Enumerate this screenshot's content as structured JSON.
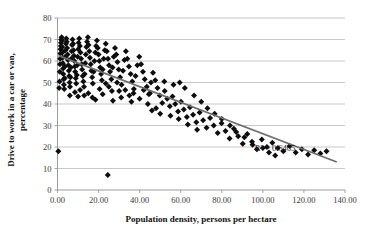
{
  "chart_data": {
    "type": "scatter",
    "title": "",
    "xlabel": "Population density, persons per hectare",
    "ylabel": "Drive to work in a car or van, percentage",
    "ylabel_line1": "Drive to work in a car or van,",
    "ylabel_line2": "percentage",
    "xlim": [
      0,
      140
    ],
    "ylim": [
      0,
      80
    ],
    "xticks": [
      0,
      20,
      40,
      60,
      80,
      100,
      120,
      140
    ],
    "xtick_labels": [
      "0.00",
      "20.00",
      "40.00",
      "60.00",
      "80.00",
      "100.00",
      "120.00",
      "140.00"
    ],
    "yticks": [
      0,
      10,
      20,
      30,
      40,
      50,
      60,
      70,
      80
    ],
    "ytick_labels": [
      "0",
      "10",
      "20",
      "30",
      "40",
      "50",
      "60",
      "70",
      "80"
    ],
    "grid": "horizontal",
    "legend": "none",
    "marker": "diamond",
    "marker_color": "#0d0d0d",
    "trendline": {
      "type": "linear",
      "color": "#6e6e6e",
      "x_start": 0.5,
      "y_start": 62.5,
      "x_end": 136.0,
      "y_end": 13.0,
      "slope": -0.3653,
      "intercept": 62.68
    },
    "annotations": [
      {
        "name": "r-squared",
        "text": "R² = 0.6465",
        "x": 96.0,
        "y": 18.0
      }
    ],
    "r_squared": 0.6465,
    "points": [
      [
        0.4,
        18.0
      ],
      [
        24.5,
        7.0
      ],
      [
        0.8,
        47.5
      ],
      [
        1.0,
        50.5
      ],
      [
        1.1,
        55.0
      ],
      [
        1.2,
        58.5
      ],
      [
        1.3,
        61.0
      ],
      [
        1.4,
        63.5
      ],
      [
        1.5,
        65.5
      ],
      [
        1.6,
        67.0
      ],
      [
        1.7,
        68.5
      ],
      [
        1.8,
        70.0
      ],
      [
        2.0,
        71.0
      ],
      [
        2.2,
        69.5
      ],
      [
        2.3,
        66.5
      ],
      [
        2.4,
        64.0
      ],
      [
        2.5,
        61.5
      ],
      [
        2.6,
        59.0
      ],
      [
        2.7,
        56.5
      ],
      [
        2.8,
        54.0
      ],
      [
        3.0,
        51.5
      ],
      [
        3.1,
        49.0
      ],
      [
        3.3,
        47.0
      ],
      [
        3.5,
        52.0
      ],
      [
        3.6,
        57.5
      ],
      [
        3.8,
        62.0
      ],
      [
        3.9,
        65.0
      ],
      [
        4.1,
        68.0
      ],
      [
        4.3,
        70.5
      ],
      [
        4.5,
        69.0
      ],
      [
        4.7,
        66.0
      ],
      [
        4.9,
        63.0
      ],
      [
        5.1,
        60.5
      ],
      [
        5.3,
        58.0
      ],
      [
        5.5,
        55.5
      ],
      [
        5.7,
        53.0
      ],
      [
        5.9,
        50.0
      ],
      [
        6.1,
        48.0
      ],
      [
        6.3,
        52.5
      ],
      [
        6.5,
        57.0
      ],
      [
        6.7,
        61.0
      ],
      [
        6.9,
        64.5
      ],
      [
        7.1,
        67.5
      ],
      [
        7.3,
        70.0
      ],
      [
        7.6,
        68.0
      ],
      [
        7.8,
        65.0
      ],
      [
        8.0,
        62.5
      ],
      [
        8.2,
        60.0
      ],
      [
        8.4,
        57.5
      ],
      [
        8.6,
        55.0
      ],
      [
        8.9,
        52.0
      ],
      [
        9.1,
        49.5
      ],
      [
        9.4,
        53.5
      ],
      [
        9.6,
        58.0
      ],
      [
        9.8,
        62.0
      ],
      [
        10.1,
        65.5
      ],
      [
        10.3,
        68.5
      ],
      [
        10.6,
        70.5
      ],
      [
        10.9,
        67.0
      ],
      [
        11.2,
        64.0
      ],
      [
        11.5,
        61.0
      ],
      [
        11.8,
        58.5
      ],
      [
        12.0,
        56.0
      ],
      [
        12.3,
        53.0
      ],
      [
        12.6,
        50.5
      ],
      [
        12.9,
        48.0
      ],
      [
        13.2,
        54.0
      ],
      [
        13.5,
        59.0
      ],
      [
        13.8,
        63.0
      ],
      [
        14.1,
        66.5
      ],
      [
        14.4,
        69.0
      ],
      [
        14.8,
        71.0
      ],
      [
        15.1,
        67.5
      ],
      [
        15.5,
        64.5
      ],
      [
        15.8,
        61.5
      ],
      [
        16.2,
        58.5
      ],
      [
        16.5,
        55.5
      ],
      [
        16.9,
        52.5
      ],
      [
        17.2,
        49.5
      ],
      [
        17.6,
        55.0
      ],
      [
        18.0,
        60.0
      ],
      [
        18.4,
        64.0
      ],
      [
        18.8,
        67.0
      ],
      [
        19.2,
        69.5
      ],
      [
        19.6,
        66.0
      ],
      [
        20.0,
        63.0
      ],
      [
        20.4,
        60.0
      ],
      [
        20.8,
        57.0
      ],
      [
        21.2,
        54.0
      ],
      [
        21.6,
        51.0
      ],
      [
        22.0,
        56.0
      ],
      [
        22.5,
        61.0
      ],
      [
        23.0,
        65.0
      ],
      [
        23.5,
        68.0
      ],
      [
        24.0,
        64.5
      ],
      [
        24.6,
        61.0
      ],
      [
        25.1,
        58.0
      ],
      [
        25.6,
        55.0
      ],
      [
        26.2,
        51.5
      ],
      [
        26.8,
        57.0
      ],
      [
        27.4,
        62.0
      ],
      [
        28.0,
        66.0
      ],
      [
        28.6,
        63.0
      ],
      [
        29.2,
        59.5
      ],
      [
        29.8,
        56.0
      ],
      [
        30.5,
        52.5
      ],
      [
        31.2,
        49.0
      ],
      [
        31.9,
        55.5
      ],
      [
        32.6,
        60.5
      ],
      [
        33.3,
        64.5
      ],
      [
        34.0,
        61.0
      ],
      [
        34.8,
        57.5
      ],
      [
        35.6,
        54.0
      ],
      [
        36.4,
        50.5
      ],
      [
        37.2,
        47.0
      ],
      [
        38.0,
        53.0
      ],
      [
        38.9,
        58.0
      ],
      [
        39.8,
        62.0
      ],
      [
        40.7,
        58.5
      ],
      [
        41.6,
        55.0
      ],
      [
        42.5,
        51.5
      ],
      [
        43.5,
        48.0
      ],
      [
        44.5,
        44.5
      ],
      [
        45.5,
        50.0
      ],
      [
        46.5,
        54.5
      ],
      [
        47.6,
        51.0
      ],
      [
        48.7,
        47.5
      ],
      [
        49.8,
        44.0
      ],
      [
        51.0,
        40.5
      ],
      [
        52.2,
        46.0
      ],
      [
        53.4,
        42.5
      ],
      [
        54.7,
        39.0
      ],
      [
        56.0,
        43.5
      ],
      [
        57.3,
        40.0
      ],
      [
        58.7,
        36.5
      ],
      [
        60.1,
        41.0
      ],
      [
        61.5,
        37.5
      ],
      [
        63.0,
        34.0
      ],
      [
        64.5,
        38.5
      ],
      [
        66.0,
        35.0
      ],
      [
        67.6,
        31.5
      ],
      [
        69.2,
        36.0
      ],
      [
        70.9,
        32.5
      ],
      [
        72.6,
        29.0
      ],
      [
        74.3,
        33.5
      ],
      [
        76.1,
        30.0
      ],
      [
        78.0,
        26.5
      ],
      [
        79.9,
        31.0
      ],
      [
        81.8,
        27.5
      ],
      [
        83.8,
        24.0
      ],
      [
        85.9,
        28.5
      ],
      [
        88.0,
        25.0
      ],
      [
        90.2,
        21.5
      ],
      [
        92.4,
        26.0
      ],
      [
        94.7,
        22.5
      ],
      [
        97.1,
        19.0
      ],
      [
        99.5,
        23.5
      ],
      [
        102.0,
        20.0
      ],
      [
        104.6,
        22.0
      ],
      [
        107.3,
        19.5
      ],
      [
        110.0,
        18.0
      ],
      [
        113.0,
        20.5
      ],
      [
        116.0,
        17.5
      ],
      [
        119.0,
        19.0
      ],
      [
        122.0,
        16.5
      ],
      [
        125.0,
        18.5
      ],
      [
        128.0,
        17.0
      ],
      [
        131.0,
        18.0
      ],
      [
        10.0,
        43.5
      ],
      [
        13.0,
        44.0
      ],
      [
        18.5,
        42.0
      ],
      [
        22.0,
        44.5
      ],
      [
        27.0,
        41.5
      ],
      [
        30.0,
        46.0
      ],
      [
        35.0,
        44.0
      ],
      [
        40.0,
        42.5
      ],
      [
        44.0,
        40.0
      ],
      [
        48.0,
        38.0
      ],
      [
        33.0,
        46.5
      ],
      [
        37.0,
        45.0
      ],
      [
        46.0,
        37.0
      ],
      [
        50.0,
        35.5
      ],
      [
        55.0,
        34.5
      ],
      [
        59.0,
        33.0
      ],
      [
        63.5,
        30.5
      ],
      [
        68.0,
        28.0
      ],
      [
        25.0,
        48.0
      ],
      [
        29.0,
        50.0
      ],
      [
        42.0,
        46.5
      ],
      [
        45.0,
        45.0
      ],
      [
        52.0,
        50.5
      ],
      [
        56.5,
        49.0
      ],
      [
        59.5,
        50.0
      ],
      [
        62.0,
        47.5
      ],
      [
        66.5,
        44.0
      ],
      [
        70.0,
        41.0
      ],
      [
        73.0,
        38.0
      ],
      [
        76.5,
        35.5
      ],
      [
        80.0,
        33.0
      ],
      [
        84.0,
        30.0
      ],
      [
        87.0,
        27.0
      ],
      [
        91.0,
        24.5
      ],
      [
        95.0,
        21.0
      ],
      [
        100.0,
        19.5
      ],
      [
        103.0,
        17.5
      ],
      [
        106.0,
        16.0
      ],
      [
        6.0,
        44.0
      ],
      [
        8.5,
        45.5
      ],
      [
        11.0,
        46.5
      ],
      [
        15.0,
        45.0
      ],
      [
        17.0,
        43.0
      ],
      [
        20.5,
        47.0
      ],
      [
        23.5,
        49.5
      ],
      [
        26.5,
        46.0
      ],
      [
        31.0,
        43.0
      ],
      [
        36.0,
        41.0
      ]
    ]
  }
}
